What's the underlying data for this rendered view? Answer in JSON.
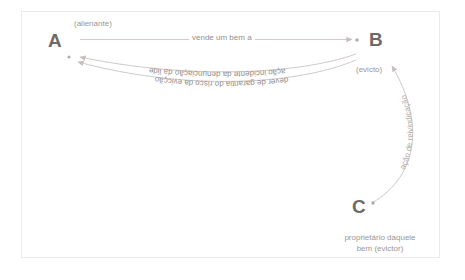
{
  "diagram": {
    "colors": {
      "node_letter": "#6e6a68",
      "caption": "#9c9694",
      "edge_label": "#938d8b",
      "edge_line": "#cfcac8",
      "dot": "#b0aaa8",
      "frame": "#eceaea",
      "background": "#ffffff"
    },
    "nodes": [
      {
        "id": "A",
        "letter": "A",
        "caption": "(alienante)"
      },
      {
        "id": "B",
        "letter": "B",
        "caption": "(evicto)"
      },
      {
        "id": "C",
        "letter": "C",
        "caption_line1": "proprietário daquele",
        "caption_line2": "bem (evictor)"
      }
    ],
    "edges": [
      {
        "id": "a-to-b",
        "label": "vende um bem a",
        "from": "A",
        "to": "B",
        "style": "straight"
      },
      {
        "id": "b-to-a-1",
        "label": "ação incidente da denunciação da lide",
        "from": "B",
        "to": "A",
        "style": "curved"
      },
      {
        "id": "b-to-a-2",
        "label": "dever de garantia do risco da evicção",
        "from": "B",
        "to": "A",
        "style": "curved"
      },
      {
        "id": "c-to-b",
        "label": "ação de reivindicação",
        "from": "C",
        "to": "B",
        "style": "curved-vertical"
      }
    ]
  }
}
